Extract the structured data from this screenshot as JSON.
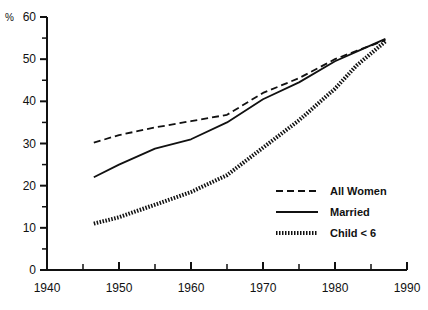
{
  "chart_data": {
    "type": "line",
    "title": "",
    "subtitle": "",
    "xlabel": "",
    "ylabel": "%",
    "xlim": [
      1940,
      1990
    ],
    "ylim": [
      0,
      60
    ],
    "xticks": [
      1940,
      1950,
      1960,
      1970,
      1980,
      1990
    ],
    "xtick_labels": [
      "1940",
      "1950",
      "1960",
      "1970",
      "1980",
      "1990"
    ],
    "xminor_ticks": [
      1945,
      1955,
      1965,
      1975,
      1985
    ],
    "yticks": [
      0,
      10,
      20,
      30,
      40,
      50,
      60
    ],
    "ytick_labels": [
      "0",
      "10",
      "20",
      "30",
      "40",
      "50",
      "60"
    ],
    "yminor_ticks": [
      5,
      15,
      25,
      35,
      45,
      55
    ],
    "grid": false,
    "legend_position": "center-right",
    "series": [
      {
        "name": "All Women",
        "style": "dashed",
        "x": [
          1946.5,
          1950,
          1955,
          1960,
          1965,
          1970,
          1975,
          1980,
          1983,
          1987
        ],
        "values": [
          30.2,
          32.0,
          33.8,
          35.3,
          36.8,
          42.0,
          45.5,
          50.0,
          52.0,
          54.5
        ]
      },
      {
        "name": "Married",
        "style": "solid",
        "x": [
          1946.5,
          1950,
          1955,
          1960,
          1965,
          1970,
          1975,
          1980,
          1983,
          1987
        ],
        "values": [
          22.0,
          25.0,
          28.8,
          31.0,
          35.0,
          40.5,
          44.5,
          49.5,
          51.8,
          54.8
        ]
      },
      {
        "name": "Child < 6",
        "style": "dotted",
        "x": [
          1946.5,
          1950,
          1955,
          1960,
          1965,
          1970,
          1975,
          1980,
          1983,
          1987
        ],
        "values": [
          11.0,
          12.5,
          15.5,
          18.5,
          22.5,
          29.0,
          35.5,
          43.0,
          48.5,
          54.2
        ]
      }
    ]
  },
  "axis": {
    "y_unit_label": "%"
  },
  "legend": {
    "items": [
      {
        "label": "All Women",
        "style": "dashed"
      },
      {
        "label": "Married",
        "style": "solid"
      },
      {
        "label": "Child < 6",
        "style": "dotted"
      }
    ]
  },
  "colors": {
    "ink": "#111111",
    "background": "#ffffff"
  }
}
